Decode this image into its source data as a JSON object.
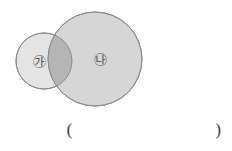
{
  "diagram": {
    "type": "venn",
    "sets": [
      {
        "label": "㉮",
        "cx": 44,
        "cy": 61,
        "r": 28,
        "fill": "#e4e4e4"
      },
      {
        "label": "㉯",
        "cx": 95,
        "cy": 59,
        "r": 47,
        "fill": "#d6d6d6"
      }
    ],
    "overlap_fill": "#b5b5b5",
    "stroke": "#8a8a8a"
  },
  "answer": {
    "open": "(",
    "close": ")"
  }
}
